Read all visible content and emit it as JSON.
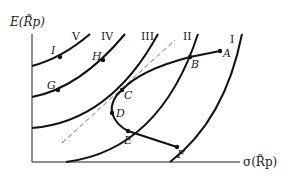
{
  "diagram": {
    "axes": {
      "y_label": "E(R̃p)",
      "x_label": "σ(R̃p)"
    },
    "indifference_curves": [
      {
        "id": "I",
        "label": "I"
      },
      {
        "id": "II",
        "label": "II"
      },
      {
        "id": "III",
        "label": "III"
      },
      {
        "id": "IV",
        "label": "IV"
      },
      {
        "id": "V",
        "label": "V"
      }
    ],
    "points": [
      {
        "id": "A",
        "label": "A"
      },
      {
        "id": "B",
        "label": "B"
      },
      {
        "id": "C",
        "label": "C"
      },
      {
        "id": "D",
        "label": "D"
      },
      {
        "id": "E",
        "label": "E"
      },
      {
        "id": "F",
        "label": "F"
      },
      {
        "id": "G",
        "label": "G"
      },
      {
        "id": "H",
        "label": "H"
      },
      {
        "id": "I",
        "label": "I"
      }
    ],
    "colors": {
      "line": "#111111",
      "dashed": "#777777",
      "background": "#ffffff"
    }
  }
}
